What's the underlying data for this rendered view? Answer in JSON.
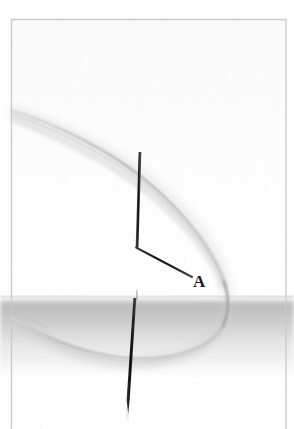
{
  "figure": {
    "kind": "scanned-surgical-illustration",
    "width": 294,
    "height": 429,
    "background_color": "#ffffff",
    "scan_border": {
      "name": "scan-frame-border",
      "color": "#c9c9c9",
      "left": 11,
      "top": 19,
      "right": 286,
      "bottom": 429,
      "thickness": 1.2
    },
    "labels": [
      {
        "name": "label-a",
        "text": "A",
        "x": 193,
        "y": 273,
        "color": "#1c1c1c",
        "font_size": 17,
        "bold": true
      }
    ],
    "tissue_plane": {
      "name": "tissue-surface-band",
      "surface_y": 296,
      "highlight_color": "#fdfdfd",
      "shadow_color": "#b4b4b4",
      "fade_to_color": "#ffffff",
      "fade_end_y": 372
    },
    "needle": {
      "name": "needle",
      "color": "#151515",
      "upper_shaft": {
        "x1": 140,
        "y1": 152,
        "x2": 137,
        "y2": 248,
        "width": 2.6
      },
      "angled_segment": {
        "x1": 136,
        "y1": 248,
        "x2": 192,
        "y2": 277,
        "width": 2.2
      },
      "lower_shaft": {
        "x1": 135,
        "y1": 298,
        "x2": 128,
        "y2": 414,
        "width": 2.4
      }
    },
    "suture_thread": {
      "name": "suture-thread-loop",
      "color": "#b9b9b9",
      "highlight_color": "#d8d8d8",
      "stroke_width": 2.4,
      "entry_point": {
        "x": 11,
        "y": 110
      },
      "loop_apex_right": {
        "x": 228,
        "y": 292
      },
      "loop_bottom": {
        "x": 120,
        "y": 356
      },
      "exit_point": {
        "x": 11,
        "y": 318
      }
    }
  }
}
